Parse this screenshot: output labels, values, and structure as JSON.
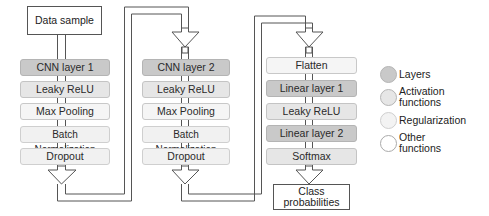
{
  "diagram": {
    "input_label": "Data sample",
    "output_label": "Class probabilities",
    "columns": [
      {
        "blocks": [
          {
            "label": "CNN layer 1",
            "type": "layer"
          },
          {
            "label": "Leaky ReLU",
            "type": "activation"
          },
          {
            "label": "Max Pooling",
            "type": "other"
          },
          {
            "label": "Batch Normalization",
            "type": "regularization"
          },
          {
            "label": "Dropout",
            "type": "regularization"
          }
        ]
      },
      {
        "blocks": [
          {
            "label": "CNN layer 2",
            "type": "layer"
          },
          {
            "label": "Leaky ReLU",
            "type": "activation"
          },
          {
            "label": "Max Pooling",
            "type": "other"
          },
          {
            "label": "Batch Normalization",
            "type": "regularization"
          },
          {
            "label": "Dropout",
            "type": "regularization"
          }
        ]
      },
      {
        "blocks": [
          {
            "label": "Flatten",
            "type": "other"
          },
          {
            "label": "Linear layer 1",
            "type": "layer"
          },
          {
            "label": "Leaky ReLU",
            "type": "activation"
          },
          {
            "label": "Linear layer 2",
            "type": "layer"
          },
          {
            "label": "Softmax",
            "type": "activation"
          }
        ]
      }
    ],
    "output_label_lines": [
      "Class",
      "probabilities"
    ]
  },
  "legend": {
    "items": [
      {
        "label_lines": [
          "Layers"
        ],
        "color": "#c9c9c9"
      },
      {
        "label_lines": [
          "Activation",
          "functions"
        ],
        "color": "#e6e6e6"
      },
      {
        "label_lines": [
          "Regularization"
        ],
        "color": "#f3f3f3"
      },
      {
        "label_lines": [
          "Other",
          "functions"
        ],
        "color": "#ffffff"
      }
    ]
  },
  "colors": {
    "layer": "#c9c9c9",
    "activation": "#e6e6e6",
    "regularization": "#f1f1f1",
    "other": "#f5f5f5",
    "wire": "#555555"
  }
}
